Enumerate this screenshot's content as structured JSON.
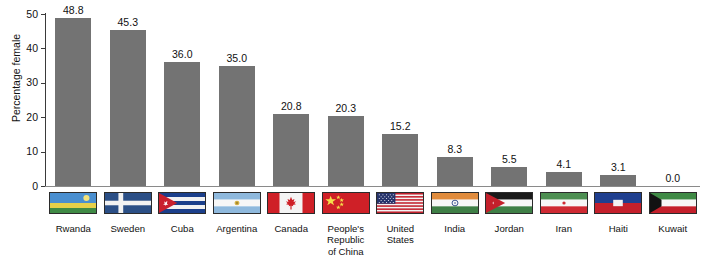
{
  "chart_data": {
    "type": "bar",
    "title": "",
    "xlabel": "",
    "ylabel": "Percentage female",
    "ylim": [
      0,
      50
    ],
    "yticks": [
      0,
      10,
      20,
      30,
      40,
      50
    ],
    "grid": false,
    "legend": "none",
    "bar_color": "#737373",
    "categories": [
      "Rwanda",
      "Sweden",
      "Cuba",
      "Argentina",
      "Canada",
      "People's\nRepublic\nof China",
      "United\nStates",
      "India",
      "Jordan",
      "Iran",
      "Haiti",
      "Kuwait"
    ],
    "values": [
      48.8,
      45.3,
      36.0,
      35.0,
      20.8,
      20.3,
      15.2,
      8.3,
      5.5,
      4.1,
      3.1,
      0.0
    ],
    "value_labels": [
      "48.8",
      "45.3",
      "36.0",
      "35.0",
      "20.8",
      "20.3",
      "15.2",
      "8.3",
      "5.5",
      "4.1",
      "3.1",
      "0.0"
    ],
    "flags": [
      {
        "country": "Rwanda",
        "icon": "flag-rwanda-icon"
      },
      {
        "country": "Sweden",
        "icon": "flag-sweden-icon"
      },
      {
        "country": "Cuba",
        "icon": "flag-cuba-icon"
      },
      {
        "country": "Argentina",
        "icon": "flag-argentina-icon"
      },
      {
        "country": "Canada",
        "icon": "flag-canada-icon"
      },
      {
        "country": "People's Republic of China",
        "icon": "flag-china-icon"
      },
      {
        "country": "United States",
        "icon": "flag-united-states-icon"
      },
      {
        "country": "India",
        "icon": "flag-india-icon"
      },
      {
        "country": "Jordan",
        "icon": "flag-jordan-icon"
      },
      {
        "country": "Iran",
        "icon": "flag-iran-icon"
      },
      {
        "country": "Haiti",
        "icon": "flag-haiti-icon"
      },
      {
        "country": "Kuwait",
        "icon": "flag-kuwait-icon"
      }
    ]
  },
  "axis": {
    "y_label": "Percentage female",
    "y_tick_labels": [
      "0",
      "10",
      "20",
      "30",
      "40",
      "50"
    ]
  }
}
